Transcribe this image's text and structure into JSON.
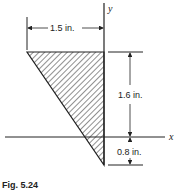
{
  "figure": {
    "caption": "Fig. 5.24",
    "axes": {
      "x_label": "x",
      "y_label": "y"
    },
    "shape": {
      "type": "right triangle",
      "fill": "hatched",
      "vertices_in": [
        [
          -1.5,
          1.6
        ],
        [
          0,
          1.6
        ],
        [
          0,
          -0.8
        ]
      ]
    },
    "dimensions": {
      "width": "1.5 in.",
      "height_above_x": "1.6 in.",
      "depth_below_x": "0.8 in."
    }
  },
  "colors": {
    "line": "#222222",
    "background": "#ffffff"
  }
}
